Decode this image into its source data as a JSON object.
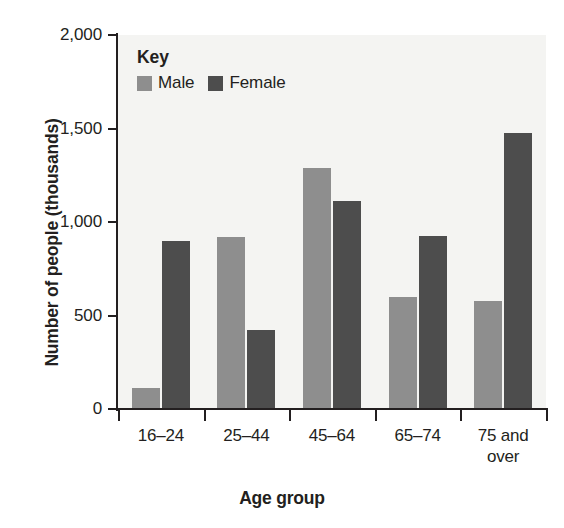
{
  "chart_data": {
    "type": "bar",
    "title": "",
    "xlabel": "Age group",
    "ylabel": "Number of people (thousands)",
    "categories": [
      "16–24",
      "25–44",
      "45–64",
      "65–74",
      "75 and over"
    ],
    "category_lines": [
      [
        "16–24"
      ],
      [
        "25–44"
      ],
      [
        "45–64"
      ],
      [
        "65–74"
      ],
      [
        "75 and",
        "over"
      ]
    ],
    "series": [
      {
        "name": "Male",
        "color": "#8e8e8e",
        "values": [
          110,
          920,
          1290,
          600,
          575
        ]
      },
      {
        "name": "Female",
        "color": "#4d4d4d",
        "values": [
          900,
          425,
          1110,
          925,
          1475
        ]
      }
    ],
    "ylim": [
      0,
      2000
    ],
    "yticks": [
      0,
      500,
      1000,
      1500,
      2000
    ],
    "ytick_labels": [
      "0",
      "500",
      "1,000",
      "1,500",
      "2,000"
    ],
    "grid": false,
    "legend_position": "inside-top-left"
  },
  "legend": {
    "title": "Key",
    "items": [
      {
        "label": "Male",
        "color": "#8e8e8e"
      },
      {
        "label": "Female",
        "color": "#4d4d4d"
      }
    ]
  },
  "axes": {
    "y_title": "Number of people (thousands)",
    "x_title": "Age group"
  },
  "colors": {
    "male": "#8e8e8e",
    "female": "#4d4d4d",
    "plot_background": "#f4f4f2",
    "axis": "#231f20",
    "page_background": "#ffffff"
  }
}
